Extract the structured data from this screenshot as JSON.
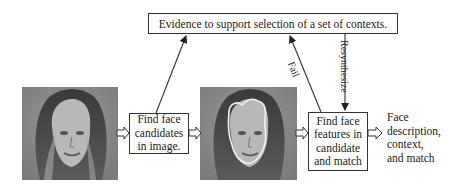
{
  "diagram": {
    "top_box": {
      "label": "Evidence to support selection of a set of contexts."
    },
    "step1": {
      "lines": [
        "Find face",
        "candidates",
        "in image."
      ]
    },
    "step2": {
      "lines": [
        "Find face",
        "features in",
        "candidate",
        "and match"
      ]
    },
    "output": {
      "lines": [
        "Face",
        "description,",
        "context,",
        "and match"
      ]
    },
    "edges": {
      "fail_label": "Fail",
      "resynthesize_label": "Resynthesize"
    },
    "images": {
      "input_face": "face-photo-grayscale",
      "candidate_face": "face-photo-with-contour-outline"
    },
    "colors": {
      "line": "#333333",
      "contour": "#f2f2f2",
      "photo_bg": "#8a8a8a"
    }
  }
}
